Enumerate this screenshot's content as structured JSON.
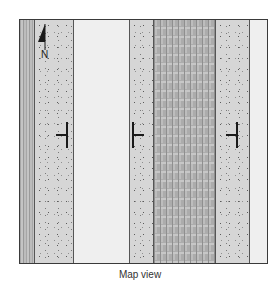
{
  "figure": {
    "caption": "Map view",
    "north_arrow": {
      "label": "N",
      "icon": "north-arrow-icon"
    },
    "frame": {
      "border_color": "#3a3a3a"
    },
    "bands": [
      {
        "id": "band-1",
        "pattern": "striped-edge",
        "left": 0,
        "width": 14,
        "color": "#b9b9b9"
      },
      {
        "id": "band-2",
        "pattern": "speckled",
        "left": 14,
        "width": 39,
        "color": "#d6d6d6"
      },
      {
        "id": "band-3",
        "pattern": "plain",
        "left": 53,
        "width": 56,
        "color": "#efefef"
      },
      {
        "id": "band-4",
        "pattern": "speckled",
        "left": 109,
        "width": 24,
        "color": "#d6d6d6"
      },
      {
        "id": "band-5",
        "pattern": "striped-dense",
        "left": 133,
        "width": 62,
        "color": "#b4b4b4"
      },
      {
        "id": "band-6",
        "pattern": "speckled",
        "left": 195,
        "width": 34,
        "color": "#d6d6d6"
      },
      {
        "id": "band-7",
        "pattern": "plain",
        "left": 229,
        "width": 20,
        "color": "#efefef"
      }
    ],
    "strike_dip_symbols": [
      {
        "id": "symbol-left",
        "x": 46,
        "y": 102,
        "dip_direction": "west"
      },
      {
        "id": "symbol-middle",
        "x": 112,
        "y": 102,
        "dip_direction": "east"
      },
      {
        "id": "symbol-right",
        "x": 216,
        "y": 102,
        "dip_direction": "west"
      }
    ]
  }
}
